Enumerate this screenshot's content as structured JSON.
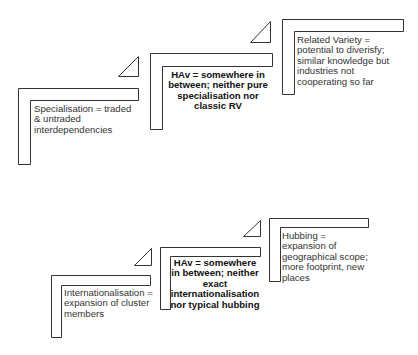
{
  "diagram": {
    "top_row": {
      "steps": [
        {
          "label": "Specialisation = traded\n&  untraded\ninterdependencies",
          "bold": false
        },
        {
          "label": "HAv = somewhere in\nbetween; neither pure\nspecialisation nor\nclassic RV",
          "bold": true
        },
        {
          "label": "Related Variety =\npotential to diverisfy;\nsimilar knowledge but\nindustries not\ncooperating so far",
          "bold": false
        }
      ]
    },
    "bottom_row": {
      "steps": [
        {
          "label": "Internationalisation =\nexpansion of cluster\nmembers",
          "bold": false
        },
        {
          "label": "HAv = somewhere\nin between; neither\nexact\ninternationalisation\nnor typical hubbing",
          "bold": true
        },
        {
          "label": "Hubbing =\nexpansion of\ngeographical scope;\nmore footprint, new\nplaces",
          "bold": false
        }
      ]
    },
    "colors": {
      "stroke": "#333333",
      "background": "#ffffff"
    }
  }
}
